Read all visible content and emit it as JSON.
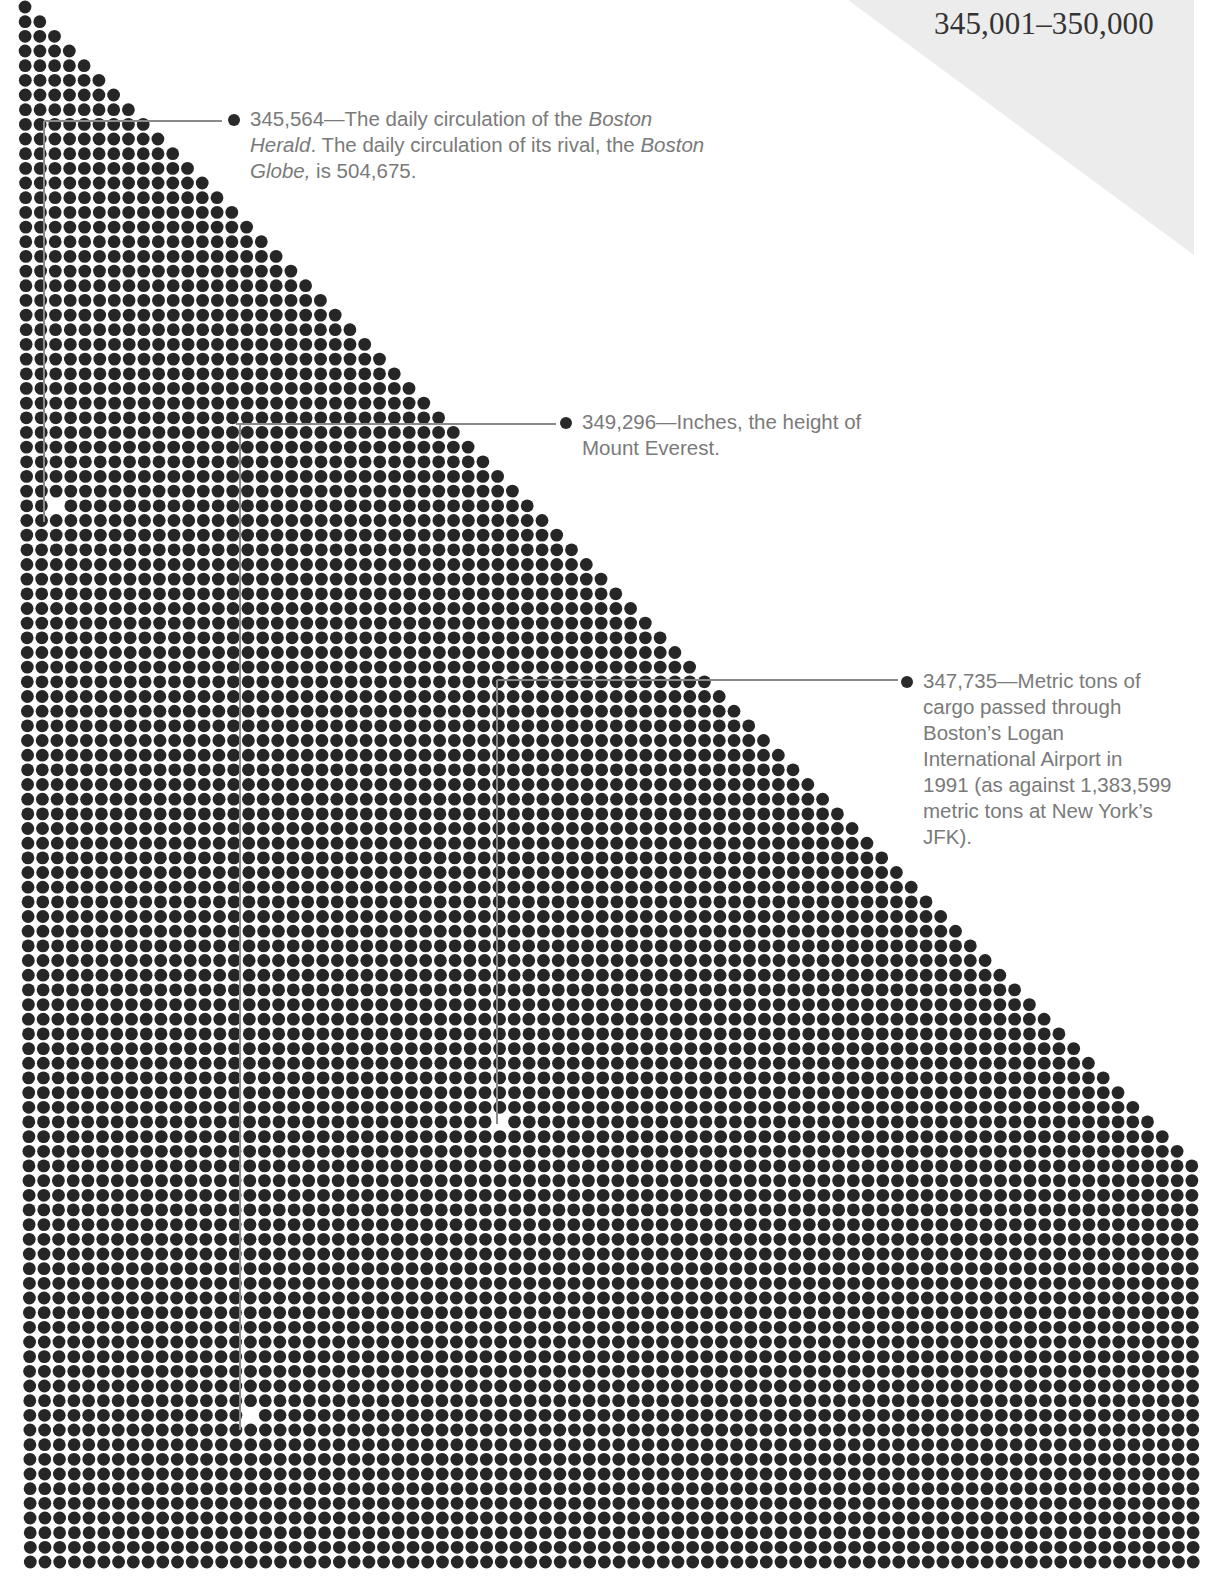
{
  "title": "345,001–350,000",
  "colors": {
    "dot": "#262626",
    "leader_line": "#8a8a8a",
    "annotation_text": "#7a7a7a",
    "title_text": "#333333",
    "corner_shade": "#ececec",
    "background": "#ffffff"
  },
  "dot_field": {
    "rows": 107,
    "max_columns": 80,
    "origin_x": 25,
    "origin_y": 7,
    "pitch_x": 14.72,
    "pitch_y": 14.67,
    "dot_radius": 6.4,
    "shape": "right-triangle, row n has min(n+1, 80) dots"
  },
  "annotations": [
    {
      "id": "boston-herald",
      "value": "345,564",
      "text_parts": [
        {
          "t": "345,564—The daily circulation of the ",
          "i": false
        },
        {
          "t": "Boston Herald",
          "i": true
        },
        {
          "t": ". The daily circulation of its rival, the ",
          "i": false
        },
        {
          "t": "Boston Globe,",
          "i": true
        },
        {
          "t": " is 504,675.",
          "i": false
        }
      ],
      "text_lines": [
        "345,564—The daily circulation of the Boston",
        "Herald. The daily circulation of its rival, the",
        "Boston Globe, is 504,675."
      ],
      "label_x": 250,
      "label_y": 106,
      "label_width": 470,
      "line_y": 121,
      "line_x_start": 44,
      "line_x_end": 222,
      "vertical_x": 44,
      "vertical_y_end": 522,
      "missing_dot": {
        "x": 53,
        "y": 509
      }
    },
    {
      "id": "mount-everest",
      "value": "349,296",
      "text_parts": [
        {
          "t": "349,296—Inches, the height of Mount Everest.",
          "i": false
        }
      ],
      "text_lines": [
        "349,296—Inches, the height",
        "of Mount Everest."
      ],
      "label_x": 582,
      "label_y": 409,
      "label_width": 310,
      "line_y": 424,
      "line_x_start": 236,
      "line_x_end": 556,
      "vertical_x": 240,
      "vertical_y_end": 1430,
      "missing_dot": {
        "x": 250,
        "y": 1422
      }
    },
    {
      "id": "logan-cargo",
      "value": "347,735",
      "text_parts": [
        {
          "t": "347,735—Metric tons of cargo passed through Boston’s Logan International Airport in 1991 (as against 1,383,599 metric tons at New York’s JFK).",
          "i": false
        }
      ],
      "text_lines": [
        "347,735—Metric tons",
        "of cargo passed",
        "through Boston’s",
        "Logan International",
        "Airport in 1991 (as",
        "against 1,383,599",
        "metric tons at New",
        "York’s JFK)."
      ],
      "label_x": 923,
      "label_y": 668,
      "label_width": 250,
      "line_y": 680,
      "line_x_start": 497,
      "line_x_end": 898,
      "vertical_x": 497,
      "vertical_y_end": 1124,
      "missing_dot": {
        "x": 507,
        "y": 1116
      }
    }
  ],
  "chart_data": {
    "type": "dot-count (unit chart)",
    "title": "345,001–350,000",
    "range": [
      345001,
      350000
    ],
    "highlights": [
      {
        "value": 345564,
        "label": "The daily circulation of the Boston Herald. The daily circulation of its rival, the Boston Globe, is 504,675."
      },
      {
        "value": 349296,
        "label": "Inches, the height of Mount Everest."
      },
      {
        "value": 347735,
        "label": "Metric tons of cargo passed through Boston’s Logan International Airport in 1991 (as against 1,383,599 metric tons at New York’s JFK)."
      }
    ],
    "related_values": [
      {
        "name": "Boston Globe daily circulation",
        "value": 504675
      },
      {
        "name": "JFK cargo 1991 (metric tons)",
        "value": 1383599
      }
    ]
  }
}
